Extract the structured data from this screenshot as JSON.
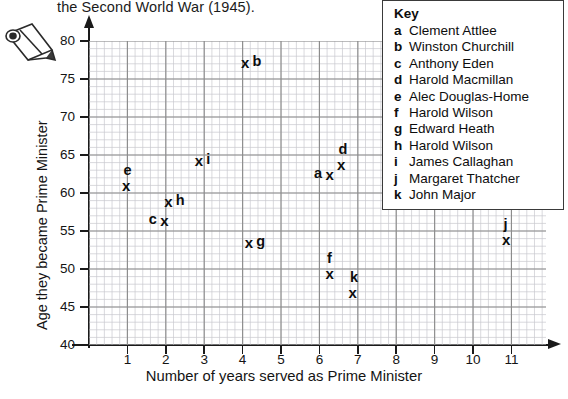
{
  "header": {
    "text": "the Second World War (1945)."
  },
  "icons": {
    "pencil": "pencil-icon"
  },
  "legend": {
    "title": "Key",
    "items": [
      {
        "key": "a",
        "name": "Clement Attlee"
      },
      {
        "key": "b",
        "name": "Winston Churchill"
      },
      {
        "key": "c",
        "name": "Anthony Eden"
      },
      {
        "key": "d",
        "name": "Harold Macmillan"
      },
      {
        "key": "e",
        "name": "Alec Douglas-Home"
      },
      {
        "key": "f",
        "name": "Harold Wilson"
      },
      {
        "key": "g",
        "name": "Edward Heath"
      },
      {
        "key": "h",
        "name": "Harold Wilson"
      },
      {
        "key": "i",
        "name": "James Callaghan"
      },
      {
        "key": "j",
        "name": "Margaret Thatcher"
      },
      {
        "key": "k",
        "name": "John Major"
      }
    ]
  },
  "chart_data": {
    "type": "scatter",
    "title": "",
    "xlabel": "Number of years served as Prime Minister",
    "ylabel": "Age they became Prime Minister",
    "xlim": [
      0,
      11.9
    ],
    "ylim": [
      40,
      80
    ],
    "xticks": [
      1,
      2,
      3,
      4,
      5,
      6,
      7,
      8,
      9,
      10,
      11
    ],
    "yticks": [
      40,
      45,
      50,
      55,
      60,
      65,
      70,
      75,
      80
    ],
    "xtick_labels": [
      "1",
      "2",
      "3",
      "4",
      "5",
      "6",
      "7",
      "8",
      "9",
      "10",
      "11"
    ],
    "ytick_labels": [
      "40",
      "45",
      "50",
      "55",
      "60",
      "65",
      "70",
      "75",
      "80"
    ],
    "grid": true,
    "grid_minor_step_x": 0.2,
    "grid_minor_step_y": 1,
    "grid_major_step_x": 1,
    "grid_major_step_y": 5,
    "marker": "x",
    "legend_position": "top-right",
    "points": [
      {
        "key": "a",
        "name": "Clement Attlee",
        "x": 6.3,
        "y": 62.5,
        "label_pos": "left"
      },
      {
        "key": "b",
        "name": "Winston Churchill",
        "x": 4.1,
        "y": 77.3,
        "label_pos": "right"
      },
      {
        "key": "c",
        "name": "Anthony Eden",
        "x": 2.0,
        "y": 56.5,
        "label_pos": "left"
      },
      {
        "key": "d",
        "name": "Harold Macmillan",
        "x": 6.6,
        "y": 63.8,
        "label_pos": "above"
      },
      {
        "key": "e",
        "name": "Alec Douglas-Home",
        "x": 1.0,
        "y": 61.0,
        "label_pos": "above"
      },
      {
        "key": "f",
        "name": "Harold Wilson",
        "x": 6.3,
        "y": 49.5,
        "label_pos": "above"
      },
      {
        "key": "g",
        "name": "Edward Heath",
        "x": 4.2,
        "y": 53.5,
        "label_pos": "right"
      },
      {
        "key": "h",
        "name": "Harold Wilson",
        "x": 2.1,
        "y": 59.0,
        "label_pos": "right"
      },
      {
        "key": "i",
        "name": "James Callaghan",
        "x": 2.9,
        "y": 64.3,
        "label_pos": "right"
      },
      {
        "key": "j",
        "name": "Margaret Thatcher",
        "x": 10.9,
        "y": 54.0,
        "label_pos": "above"
      },
      {
        "key": "k",
        "name": "John Major",
        "x": 6.9,
        "y": 47.0,
        "label_pos": "above"
      }
    ]
  },
  "colors": {
    "axis": "#1a1a1a",
    "grid_major": "#8c8c8c",
    "grid_minor": "#c9c9cf",
    "marker": "#0d0d0d",
    "legend_border": "#3a3a3a"
  }
}
